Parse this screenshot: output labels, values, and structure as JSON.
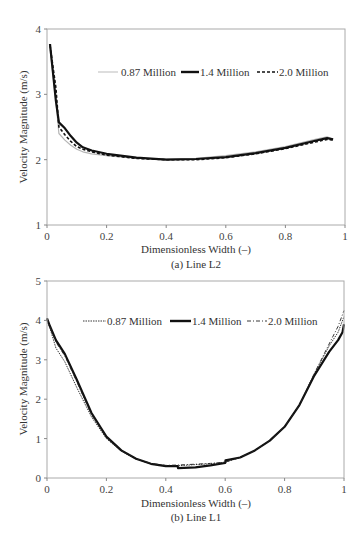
{
  "chart_data": [
    {
      "type": "line",
      "title": "",
      "caption": "(a) Line L2",
      "xlabel": "Dimensionless Width (–)",
      "ylabel": "Velocity Magnitude (m/s)",
      "xlim": [
        0,
        1
      ],
      "ylim": [
        1,
        4
      ],
      "xticks": [
        "0",
        "0.2",
        "0.4",
        "0.6",
        "0.8",
        "1"
      ],
      "yticks": [
        "1",
        "2",
        "3",
        "4"
      ],
      "grid": false,
      "legend_position": "upper-right-inside",
      "series": [
        {
          "name": "0.87 Million",
          "style": "thin-gray",
          "x": [
            0.01,
            0.03,
            0.04,
            0.06,
            0.08,
            0.1,
            0.12,
            0.15,
            0.2,
            0.3,
            0.4,
            0.5,
            0.6,
            0.7,
            0.8,
            0.9,
            0.94,
            0.96
          ],
          "y": [
            3.7,
            2.9,
            2.4,
            2.3,
            2.22,
            2.16,
            2.12,
            2.09,
            2.06,
            2.02,
            2.01,
            2.02,
            2.06,
            2.12,
            2.2,
            2.31,
            2.35,
            2.31
          ]
        },
        {
          "name": "1.4 Million",
          "style": "thick-black",
          "x": [
            0.01,
            0.03,
            0.04,
            0.06,
            0.08,
            0.1,
            0.12,
            0.15,
            0.2,
            0.3,
            0.4,
            0.5,
            0.6,
            0.7,
            0.8,
            0.9,
            0.94,
            0.96
          ],
          "y": [
            3.77,
            2.9,
            2.57,
            2.48,
            2.36,
            2.26,
            2.19,
            2.14,
            2.09,
            2.03,
            2.0,
            2.01,
            2.04,
            2.1,
            2.18,
            2.29,
            2.33,
            2.31
          ]
        },
        {
          "name": "2.0 Million",
          "style": "dashed-black",
          "x": [
            0.01,
            0.03,
            0.04,
            0.06,
            0.08,
            0.1,
            0.12,
            0.15,
            0.2,
            0.3,
            0.4,
            0.5,
            0.6,
            0.7,
            0.8,
            0.9,
            0.94,
            0.96
          ],
          "y": [
            3.75,
            3.1,
            2.5,
            2.38,
            2.28,
            2.2,
            2.16,
            2.12,
            2.07,
            2.02,
            2.0,
            2.0,
            2.03,
            2.09,
            2.17,
            2.27,
            2.31,
            2.3
          ]
        }
      ]
    },
    {
      "type": "line",
      "title": "",
      "caption": "(b) Line L1",
      "xlabel": "Dimensionless Width (–)",
      "ylabel": "Velocity  Magnitude (m/s)",
      "xlim": [
        0,
        1
      ],
      "ylim": [
        0,
        5
      ],
      "xticks": [
        "0",
        "0.2",
        "0.4",
        "0.6",
        "0.8",
        "1"
      ],
      "yticks": [
        "0",
        "1",
        "2",
        "3",
        "4",
        "5"
      ],
      "grid": false,
      "legend_position": "upper-center-inside",
      "series": [
        {
          "name": "0.87 Million",
          "style": "dotted-black",
          "x": [
            0.0,
            0.01,
            0.03,
            0.06,
            0.1,
            0.15,
            0.2,
            0.25,
            0.3,
            0.35,
            0.4,
            0.44,
            0.5,
            0.55,
            0.6,
            0.65,
            0.7,
            0.75,
            0.8,
            0.85,
            0.9,
            0.95,
            0.98,
            1.0
          ],
          "y": [
            4.0,
            3.8,
            3.3,
            2.95,
            2.3,
            1.55,
            1.0,
            0.68,
            0.48,
            0.36,
            0.31,
            0.31,
            0.34,
            0.36,
            0.4,
            0.52,
            0.7,
            0.95,
            1.3,
            1.85,
            2.65,
            3.35,
            3.7,
            4.1
          ]
        },
        {
          "name": "1.4 Million",
          "style": "thick-black",
          "x": [
            0.0,
            0.01,
            0.03,
            0.06,
            0.1,
            0.15,
            0.2,
            0.25,
            0.3,
            0.35,
            0.4,
            0.44,
            0.441,
            0.5,
            0.55,
            0.6,
            0.601,
            0.65,
            0.7,
            0.75,
            0.8,
            0.85,
            0.9,
            0.95,
            0.98,
            0.995,
            1.0
          ],
          "y": [
            4.05,
            3.85,
            3.5,
            3.15,
            2.5,
            1.65,
            1.05,
            0.7,
            0.49,
            0.36,
            0.3,
            0.3,
            0.25,
            0.27,
            0.32,
            0.38,
            0.45,
            0.52,
            0.7,
            0.95,
            1.3,
            1.85,
            2.6,
            3.2,
            3.5,
            3.7,
            3.9
          ]
        },
        {
          "name": "2.0 Million",
          "style": "dashdot-black",
          "x": [
            0.0,
            0.01,
            0.03,
            0.06,
            0.1,
            0.15,
            0.2,
            0.25,
            0.3,
            0.35,
            0.4,
            0.44,
            0.5,
            0.55,
            0.6,
            0.65,
            0.7,
            0.75,
            0.8,
            0.85,
            0.9,
            0.95,
            0.98,
            1.0
          ],
          "y": [
            4.05,
            3.85,
            3.45,
            3.1,
            2.45,
            1.6,
            1.03,
            0.69,
            0.49,
            0.37,
            0.32,
            0.33,
            0.35,
            0.37,
            0.4,
            0.52,
            0.7,
            0.95,
            1.3,
            1.85,
            2.65,
            3.4,
            3.85,
            4.25
          ]
        }
      ]
    }
  ],
  "legend_labels": [
    "0.87 Million",
    "1.4 Million",
    "2.0 Million"
  ],
  "colors": {
    "axis": "#999999",
    "line": "#111111",
    "gray_line": "#bbbbbb",
    "text": "#333333"
  }
}
